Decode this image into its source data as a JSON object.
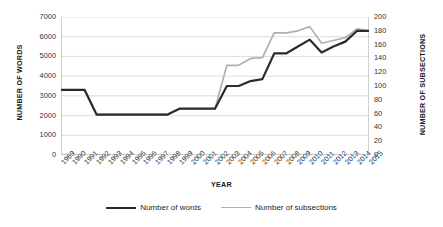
{
  "chart_data": {
    "type": "line",
    "title": "",
    "xlabel": "YEAR",
    "ylabel": "NUMBER OF WORDS",
    "y2label": "NUMBER OF SUBSECTIONS",
    "grid": true,
    "legend_position": "bottom",
    "ylim": [
      0,
      7000
    ],
    "y2lim": [
      0,
      200
    ],
    "yticks": [
      0,
      1000,
      2000,
      3000,
      4000,
      5000,
      6000,
      7000
    ],
    "y2ticks": [
      0,
      20,
      40,
      60,
      80,
      100,
      120,
      140,
      160,
      180,
      200
    ],
    "categories": [
      "1989",
      "1990",
      "1991",
      "1992",
      "1993",
      "1994",
      "1995",
      "1996",
      "1997",
      "1998",
      "1999",
      "2000",
      "2001",
      "2002",
      "2003",
      "2004",
      "2005",
      "2006",
      "2007",
      "2008",
      "2009",
      "2010",
      "2011",
      "2012",
      "2013",
      "2014",
      "2015"
    ],
    "series": [
      {
        "name": "Number of words",
        "axis": "left",
        "color": "#2b2b2b",
        "values": [
          3300,
          3300,
          3300,
          2050,
          2050,
          2050,
          2050,
          2050,
          2050,
          2050,
          2350,
          2350,
          2350,
          2350,
          3500,
          3500,
          3750,
          3850,
          5150,
          5150,
          5500,
          5850,
          5200,
          5500,
          5750,
          6300,
          6300
        ]
      },
      {
        "name": "Number of subsections",
        "axis": "right",
        "color": "#b0b0b0",
        "values": [
          94,
          94,
          94,
          59,
          59,
          59,
          59,
          59,
          59,
          59,
          67,
          67,
          67,
          67,
          130,
          130,
          140,
          141,
          177,
          177,
          180,
          186,
          162,
          166,
          170,
          183,
          180
        ]
      }
    ]
  },
  "legend": {
    "items": [
      {
        "label": "Number of words"
      },
      {
        "label": "Number of subsections"
      }
    ]
  }
}
